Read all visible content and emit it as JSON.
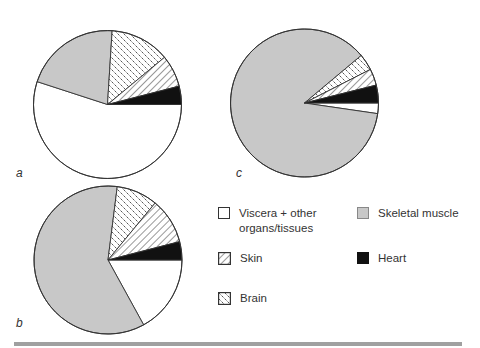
{
  "chart_data": [
    {
      "type": "pie",
      "panel": "a",
      "categories": [
        "Viscera + other organs/tissues",
        "Skeletal muscle",
        "Brain",
        "Skin",
        "Heart"
      ],
      "values": [
        55,
        21,
        13,
        7,
        4
      ],
      "units": "percent (estimated)",
      "center": [
        107.5,
        104.5
      ],
      "radius": 74
    },
    {
      "type": "pie",
      "panel": "b",
      "categories": [
        "Viscera + other organs/tissues",
        "Skeletal muscle",
        "Brain",
        "Skin",
        "Heart"
      ],
      "values": [
        17,
        60,
        9,
        10,
        4
      ],
      "units": "percent (estimated)",
      "center": [
        108,
        260
      ],
      "radius": 74
    },
    {
      "type": "pie",
      "panel": "c",
      "categories": [
        "Viscera + other organs/tissues",
        "Skeletal muscle",
        "Brain",
        "Skin",
        "Heart"
      ],
      "values": [
        2.3,
        86.6,
        3.6,
        3.6,
        3.9
      ],
      "units": "percent (estimated)",
      "center": [
        304.5,
        103
      ],
      "radius": 74
    }
  ],
  "panels": {
    "a": {
      "label": "a"
    },
    "b": {
      "label": "b"
    },
    "c": {
      "label": "c"
    }
  },
  "legend": {
    "position": "right-lower",
    "items": [
      {
        "key": "viscera",
        "label": "Viscera + other\norgans/tissues",
        "fill": "white"
      },
      {
        "key": "skeletal",
        "label": "Skeletal muscle",
        "fill": "gray"
      },
      {
        "key": "skin",
        "label": "Skin",
        "fill": "diagonal-lines"
      },
      {
        "key": "heart",
        "label": "Heart",
        "fill": "black"
      },
      {
        "key": "brain",
        "label": "Brain",
        "fill": "dashed-diagonal"
      }
    ]
  },
  "colors": {
    "viscera": "#ffffff",
    "skeletal": "#c8c8c8",
    "heart": "#111111",
    "outline": "#333333",
    "rule": "#a0a0a0"
  }
}
